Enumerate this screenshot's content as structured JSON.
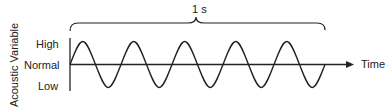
{
  "diagram": {
    "y_axis_label": "Acoustic Variable",
    "y_levels": [
      "High",
      "Normal",
      "Low"
    ],
    "x_axis_label": "Time",
    "bracket_label": "1 s",
    "wave": {
      "type": "sine",
      "cycles": 5,
      "stroke": "#222222"
    }
  }
}
